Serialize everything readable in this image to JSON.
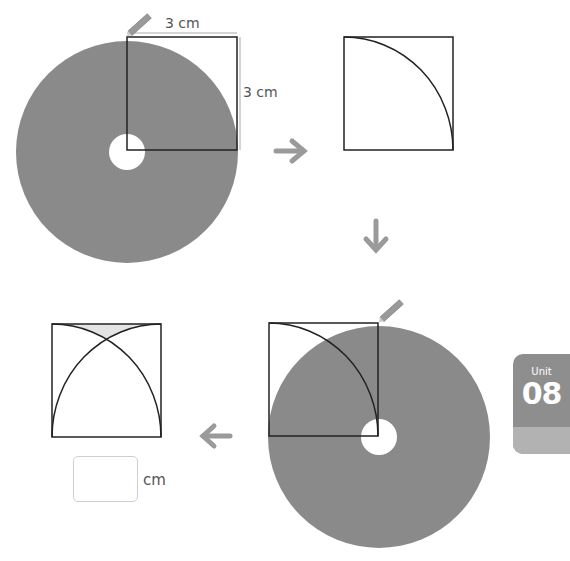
{
  "step1": {
    "width_label": "3 cm",
    "height_label": "3 cm"
  },
  "answer": {
    "value": "",
    "unit": "cm"
  },
  "unit_tab": {
    "word": "Unit",
    "number": "08"
  },
  "colors": {
    "disk": "#8a8a8a",
    "shade": "#e4e4e4",
    "arrow": "#9a9a9a",
    "line": "#222222"
  },
  "icons": [
    "pencil-icon",
    "arrow-right-icon",
    "arrow-down-icon",
    "arrow-left-icon"
  ]
}
